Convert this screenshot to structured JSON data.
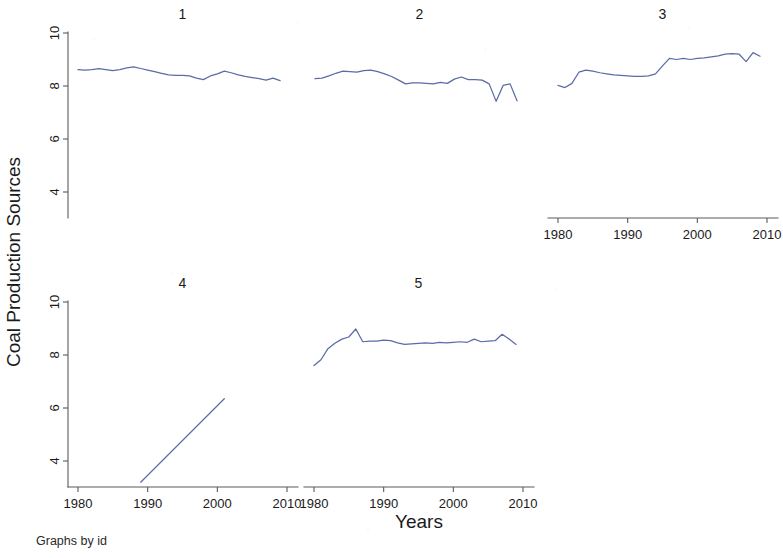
{
  "figure": {
    "y_axis_title": "Coal Production Sources",
    "x_axis_title": "Years",
    "note": "Graphs by id",
    "series_color": "#5b6ba8",
    "axis_color": "#5a5a5a",
    "background": "#ffffff"
  },
  "chart_data": {
    "type": "line",
    "title": "",
    "subtitle": "",
    "xlabel": "Years",
    "ylabel": "Coal Production Sources",
    "note": "Graphs by id",
    "layout": "small-multiples 3x2 (panels 1-3 top row, 4-5 bottom row)",
    "grid": false,
    "legend": "none",
    "xlim": [
      1978,
      2011
    ],
    "ylim": [
      3.0,
      10.6
    ],
    "xticks": [
      1980,
      1990,
      2000,
      2010
    ],
    "xtick_labels": [
      "1980",
      "1990",
      "2000",
      "2010"
    ],
    "yticks": [
      4,
      6,
      8,
      10
    ],
    "ytick_labels": [
      "4",
      "6",
      "8",
      "10"
    ],
    "panels": [
      {
        "id": "1",
        "label": "1",
        "row": 0,
        "col": 0,
        "x_axis_shown": false,
        "y_axis_shown": true,
        "series": [
          {
            "name": "Coal Production Sources",
            "x": [
              1980,
              1981,
              1982,
              1983,
              1984,
              1985,
              1986,
              1987,
              1988,
              1989,
              1990,
              1991,
              1992,
              1993,
              1994,
              1995,
              1996,
              1997,
              1998,
              1999,
              2000,
              2001,
              2002,
              2003,
              2004,
              2005,
              2006,
              2007,
              2008,
              2009
            ],
            "values": [
              8.62,
              8.6,
              8.62,
              8.66,
              8.62,
              8.58,
              8.62,
              8.68,
              8.72,
              8.66,
              8.6,
              8.54,
              8.48,
              8.42,
              8.4,
              8.4,
              8.38,
              8.3,
              8.24,
              8.38,
              8.46,
              8.56,
              8.5,
              8.42,
              8.36,
              8.32,
              8.28,
              8.22,
              8.3,
              8.2
            ]
          }
        ]
      },
      {
        "id": "2",
        "label": "2",
        "row": 0,
        "col": 1,
        "x_axis_shown": false,
        "y_axis_shown": false,
        "series": [
          {
            "name": "Coal Production Sources",
            "x": [
              1980,
              1981,
              1982,
              1983,
              1984,
              1985,
              1986,
              1987,
              1988,
              1989,
              1990,
              1991,
              1992,
              1993,
              1994,
              1995,
              1996,
              1997,
              1998,
              1999,
              2000,
              2001,
              2002,
              2003,
              2004,
              2005,
              2006,
              2007,
              2008,
              2009
            ],
            "values": [
              8.28,
              8.3,
              8.38,
              8.48,
              8.56,
              8.54,
              8.52,
              8.58,
              8.6,
              8.54,
              8.46,
              8.36,
              8.22,
              8.08,
              8.12,
              8.12,
              8.1,
              8.08,
              8.14,
              8.1,
              8.26,
              8.34,
              8.24,
              8.24,
              8.22,
              8.08,
              7.42,
              8.02,
              8.08,
              7.44
            ]
          }
        ]
      },
      {
        "id": "3",
        "label": "3",
        "row": 0,
        "col": 2,
        "x_axis_shown": true,
        "y_axis_shown": false,
        "series": [
          {
            "name": "Coal Production Sources",
            "x": [
              1980,
              1981,
              1982,
              1983,
              1984,
              1985,
              1986,
              1987,
              1988,
              1989,
              1990,
              1991,
              1992,
              1993,
              1994,
              1995,
              1996,
              1997,
              1998,
              1999,
              2000,
              2001,
              2002,
              2003,
              2004,
              2005,
              2006,
              2007,
              2008,
              2009
            ],
            "values": [
              8.02,
              7.94,
              8.1,
              8.52,
              8.6,
              8.56,
              8.5,
              8.46,
              8.42,
              8.4,
              8.38,
              8.36,
              8.36,
              8.38,
              8.46,
              8.76,
              9.04,
              9.0,
              9.04,
              9.0,
              9.04,
              9.06,
              9.1,
              9.14,
              9.2,
              9.22,
              9.2,
              8.92,
              9.26,
              9.12
            ]
          }
        ]
      },
      {
        "id": "4",
        "label": "4",
        "row": 1,
        "col": 0,
        "x_axis_shown": true,
        "y_axis_shown": true,
        "series": [
          {
            "name": "Coal Production Sources",
            "x": [
              1989,
              2001
            ],
            "values": [
              3.2,
              6.35
            ]
          }
        ]
      },
      {
        "id": "5",
        "label": "5",
        "row": 1,
        "col": 1,
        "x_axis_shown": true,
        "y_axis_shown": false,
        "series": [
          {
            "name": "Coal Production Sources",
            "x": [
              1980,
              1981,
              1982,
              1983,
              1984,
              1985,
              1986,
              1987,
              1988,
              1989,
              1990,
              1991,
              1992,
              1993,
              1994,
              1995,
              1996,
              1997,
              1998,
              1999,
              2000,
              2001,
              2002,
              2003,
              2004,
              2005,
              2006,
              2007,
              2008,
              2009
            ],
            "values": [
              7.6,
              7.82,
              8.24,
              8.44,
              8.6,
              8.68,
              8.98,
              8.5,
              8.52,
              8.52,
              8.56,
              8.54,
              8.46,
              8.4,
              8.42,
              8.44,
              8.46,
              8.44,
              8.48,
              8.46,
              8.48,
              8.5,
              8.48,
              8.6,
              8.5,
              8.52,
              8.54,
              8.78,
              8.6,
              8.4
            ]
          }
        ]
      }
    ]
  }
}
